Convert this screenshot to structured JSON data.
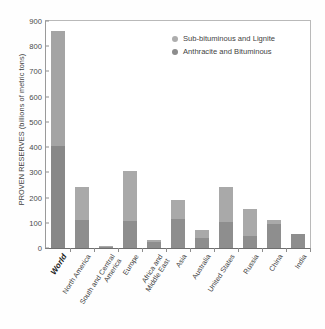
{
  "chart_data": {
    "type": "bar",
    "title": "",
    "xlabel": "",
    "ylabel": "PROVEN RESERVES (billions of metric tons)",
    "ylim": [
      0,
      900
    ],
    "yticks": [
      0,
      100,
      200,
      300,
      400,
      500,
      600,
      700,
      800,
      900
    ],
    "grid": false,
    "stacked": true,
    "legend_position": "top-right",
    "categories": [
      "World",
      "North America",
      "South and Central\nAmerica",
      "Europe",
      "Africa and\nMiddle East",
      "Asia",
      "Australia",
      "United States",
      "Russia",
      "China",
      "India"
    ],
    "highlight_category": "World",
    "series": [
      {
        "name": "Anthracite and Bituminous",
        "color": "#8e8e8e",
        "values": [
          405,
          110,
          6,
          107,
          22,
          115,
          38,
          103,
          49,
          97,
          57
        ]
      },
      {
        "name": "Sub-bituminous and Lignite",
        "color": "#a9a9a9",
        "values": [
          455,
          132,
          4,
          198,
          10,
          75,
          35,
          137,
          106,
          15,
          0
        ]
      }
    ],
    "totals": [
      860,
      242,
      10,
      305,
      32,
      190,
      73,
      240,
      155,
      112,
      57
    ]
  },
  "legend": {
    "items": [
      {
        "label": "Sub-bituminous and Lignite",
        "swatch": "light"
      },
      {
        "label": "Anthracite and Bituminous",
        "swatch": "dark"
      }
    ]
  },
  "caption": {
    "text": ""
  }
}
